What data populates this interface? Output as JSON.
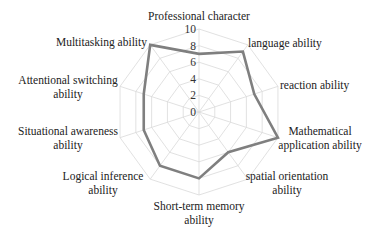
{
  "chart_data": {
    "type": "radar",
    "title": "",
    "categories": [
      [
        "Professional character"
      ],
      [
        "language ability"
      ],
      [
        "reaction ability"
      ],
      [
        "Mathematical",
        "application ability"
      ],
      [
        "spatial orientation",
        "ability"
      ],
      [
        "Short-term memory",
        "ability"
      ],
      [
        "Logical inference",
        "ability"
      ],
      [
        "Situational awareness",
        "ability"
      ],
      [
        "Attentional  switching",
        "ability"
      ],
      [
        "Multitasking ability"
      ]
    ],
    "series": [
      {
        "name": "Ability score",
        "values": [
          7,
          9,
          7,
          10,
          6,
          8,
          8,
          7,
          7,
          10
        ],
        "color": "#7f7f7f"
      }
    ],
    "radial_ticks": [
      "0",
      "2",
      "4",
      "6",
      "8",
      "10"
    ],
    "rlim": [
      0,
      10
    ],
    "grid": true,
    "grid_color": "#d9d9d9",
    "legend": "none"
  }
}
